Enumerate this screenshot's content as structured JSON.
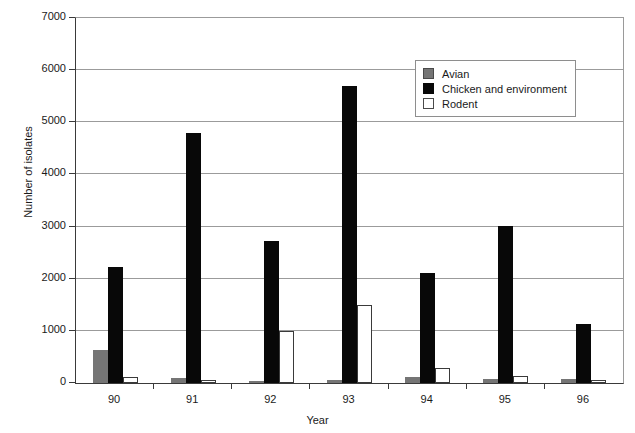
{
  "chart_data": {
    "type": "bar",
    "title": "",
    "xlabel": "Year",
    "ylabel": "Number of isolates",
    "categories": [
      "90",
      "91",
      "92",
      "93",
      "94",
      "95",
      "96"
    ],
    "series": [
      {
        "name": "Avian",
        "color": "#757575",
        "values": [
          630,
          100,
          40,
          60,
          110,
          70,
          70
        ]
      },
      {
        "name": "Chicken and environment",
        "color": "#080808",
        "values": [
          2230,
          4790,
          2730,
          5700,
          2110,
          3020,
          1140
        ]
      },
      {
        "name": "Rodent",
        "color": "#ffffff",
        "values": [
          120,
          50,
          1000,
          1500,
          290,
          140,
          60
        ]
      }
    ],
    "ylim": [
      0,
      7000
    ],
    "yticks": [
      0,
      1000,
      2000,
      3000,
      4000,
      5000,
      6000,
      7000
    ],
    "ytick_labels": [
      "0",
      "1000",
      "2000",
      "3000",
      "4000",
      "5000",
      "6000",
      "7000"
    ],
    "grid": true,
    "legend_position": "upper right",
    "legend_entries": [
      "Avian",
      "Chicken and environment",
      "Rodent"
    ]
  }
}
